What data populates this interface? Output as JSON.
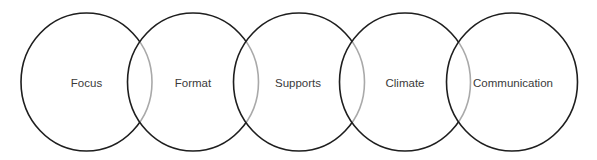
{
  "diagram": {
    "type": "overlapping-circles-chain",
    "stroke_color": "#1e1e1e",
    "overlap_stroke_color": "#aaaaaa",
    "label_color": "#3a3a3a",
    "background": "#ffffff",
    "circles": [
      {
        "label": "Focus",
        "cx": 86.5,
        "cy": 82,
        "rx": 65.5,
        "ry": 69
      },
      {
        "label": "Format",
        "cx": 193,
        "cy": 82,
        "rx": 65.5,
        "ry": 69
      },
      {
        "label": "Supports",
        "cx": 299,
        "cy": 82,
        "rx": 65.5,
        "ry": 69
      },
      {
        "label": "Climate",
        "cx": 405,
        "cy": 82,
        "rx": 65.5,
        "ry": 69
      },
      {
        "label": "Communication",
        "cx": 512,
        "cy": 82,
        "rx": 65.5,
        "ry": 69
      }
    ]
  }
}
